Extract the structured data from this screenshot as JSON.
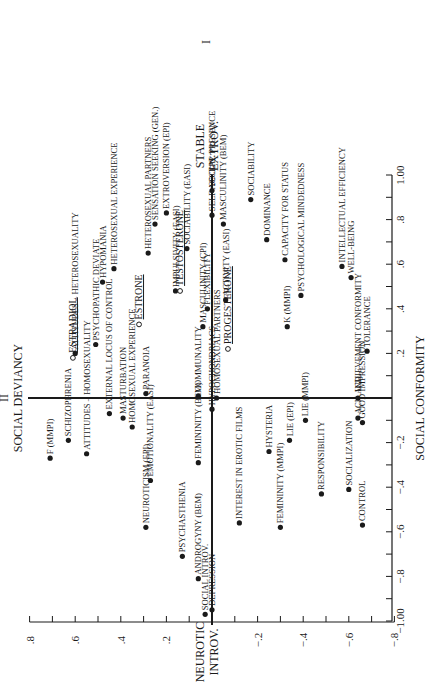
{
  "chart_data": {
    "type": "scatter",
    "title": "",
    "rotation": "rotated 90deg counter-clockwise on page",
    "xlabel": "SOCIAL CONFORMITY",
    "ylabel": "NEUROTIC INTROV. — STABLE EXTROV.",
    "factor_labels": {
      "factor_I_pos": "STABLE EXTROV.",
      "factor_I_neg": "NEUROTIC INTROV.",
      "factor_I_numeral": "I",
      "factor_II_label": "SOCIAL DEVIANCY",
      "factor_II_numeral": "II"
    },
    "xlim": [
      -1.0,
      1.0
    ],
    "ylim": [
      -0.8,
      0.8
    ],
    "x_ticks": [
      "-1.00",
      "-.8",
      "-.6",
      "-.4",
      "-.2",
      ".2",
      ".4",
      ".6",
      ".8",
      "1.00"
    ],
    "y_ticks": [
      ".8",
      ".6",
      ".4",
      ".2",
      "-.2",
      "-.4",
      "-.6",
      "-.8"
    ],
    "grid": false,
    "series": [
      {
        "name": "Personality / behavior variables",
        "marker": "filled-circle",
        "points": [
          {
            "label": "SOCIAL PRESENCE",
            "x": 0.93,
            "y": 0.0
          },
          {
            "label": "MASCULINITY (BEM)",
            "x": 0.78,
            "y": -0.05
          },
          {
            "label": "SOCIABILITY",
            "x": 0.89,
            "y": -0.17
          },
          {
            "label": "SELF ACCEPT.",
            "x": 0.82,
            "y": 0.0
          },
          {
            "label": "SOCIABILITY (EASI)",
            "x": 0.67,
            "y": 0.11
          },
          {
            "label": "SENSATION SEEKING (GEN.)",
            "x": 0.78,
            "y": 0.25
          },
          {
            "label": "EXTROVERSION (EPI)",
            "x": 0.83,
            "y": 0.2
          },
          {
            "label": "HETEROSEXUAL PARTNERS",
            "x": 0.65,
            "y": 0.28
          },
          {
            "label": "HETEROSEXUAL EXPERIENCE",
            "x": 0.58,
            "y": 0.43
          },
          {
            "label": "HYPOMANIA",
            "x": 0.52,
            "y": 0.48
          },
          {
            "label": "ATTITUDES – HETEROSEXUALITY",
            "x": 0.2,
            "y": 0.6
          },
          {
            "label": "PSYCHOPATHIC DEVIATE",
            "x": 0.24,
            "y": 0.51
          },
          {
            "label": "PARANOIA",
            "x": 0.02,
            "y": 0.29
          },
          {
            "label": "IMPULSIVITY (EASI)",
            "x": 0.48,
            "y": 0.16
          },
          {
            "label": "FLEXIBILITY",
            "x": 0.4,
            "y": 0.02
          },
          {
            "label": "MASCULINITY (CPI)",
            "x": 0.32,
            "y": 0.04
          },
          {
            "label": "ACTIVITY (EASI)",
            "x": 0.44,
            "y": -0.06
          },
          {
            "label": "DOMINANCE",
            "x": 0.71,
            "y": -0.24
          },
          {
            "label": "CAPACITY FOR STATUS",
            "x": 0.62,
            "y": -0.32
          },
          {
            "label": "K (MMPI)",
            "x": 0.32,
            "y": -0.33
          },
          {
            "label": "PSYCHOLOGICAL MINDEDNESS",
            "x": 0.46,
            "y": -0.39
          },
          {
            "label": "INTELLECTUAL EFFICIENCY",
            "x": 0.59,
            "y": -0.57
          },
          {
            "label": "WELL-BEING",
            "x": 0.54,
            "y": -0.61
          },
          {
            "label": "TOLERANCE",
            "x": 0.21,
            "y": -0.68
          },
          {
            "label": "ACHIEVEMENT CONFORMITY",
            "x": 0.0,
            "y": -0.64
          },
          {
            "label": "ACH. IND.",
            "x": -0.09,
            "y": -0.64
          },
          {
            "label": "GOOD IMPRESSION",
            "x": -0.11,
            "y": -0.66
          },
          {
            "label": "LIE (MMPI)",
            "x": -0.1,
            "y": -0.41
          },
          {
            "label": "LIE (EPI)",
            "x": -0.19,
            "y": -0.34
          },
          {
            "label": "HYSTERIA",
            "x": -0.24,
            "y": -0.25
          },
          {
            "label": "HOMOSEXUAL PARTNERS",
            "x": 0.0,
            "y": -0.02
          },
          {
            "label": "HYPOCHONDRIACS",
            "x": -0.05,
            "y": 0.0
          },
          {
            "label": "COMMUNALITY",
            "x": 0.01,
            "y": 0.06
          },
          {
            "label": "FEMININITY (BEM)",
            "x": -0.29,
            "y": 0.06
          },
          {
            "label": "INTEREST IN EROTIC FILMS",
            "x": -0.56,
            "y": -0.12
          },
          {
            "label": "FEMININITY (MMPI)",
            "x": -0.58,
            "y": -0.3
          },
          {
            "label": "RESPONSIBILITY",
            "x": -0.43,
            "y": -0.48
          },
          {
            "label": "SOCIALIZATION",
            "x": -0.41,
            "y": -0.6
          },
          {
            "label": "CONTROL",
            "x": -0.57,
            "y": -0.66
          },
          {
            "label": "DEPRESSION",
            "x": -0.95,
            "y": 0.0
          },
          {
            "label": "SOCIAL INTROV.",
            "x": -0.97,
            "y": 0.03
          },
          {
            "label": "ANDROGYNY (BEM)",
            "x": -0.81,
            "y": 0.06
          },
          {
            "label": "PSYCHASTHENIA",
            "x": -0.71,
            "y": 0.13
          },
          {
            "label": "NEUROTICISM (EPI)",
            "x": -0.58,
            "y": 0.29
          },
          {
            "label": "EMOTIONALITY (EASI)",
            "x": -0.37,
            "y": 0.27
          },
          {
            "label": "EXTERNAL LOCUS OF CONTROL",
            "x": -0.07,
            "y": 0.45
          },
          {
            "label": "MASTURBATION",
            "x": -0.09,
            "y": 0.39
          },
          {
            "label": "HOMOSEXUAL EXPERIENCE",
            "x": -0.13,
            "y": 0.35
          },
          {
            "label": "ATTITUDES – HOMOSEXUALITY",
            "x": -0.25,
            "y": 0.55
          },
          {
            "label": "SCHIZOPHRENIA",
            "x": -0.19,
            "y": 0.63
          },
          {
            "label": "F (MMPI)",
            "x": -0.27,
            "y": 0.71
          }
        ]
      },
      {
        "name": "Hormones",
        "marker": "open-circle",
        "points": [
          {
            "label": "ESTRADIOL",
            "x": 0.18,
            "y": 0.61
          },
          {
            "label": "ESTRONE",
            "x": 0.33,
            "y": 0.32
          },
          {
            "label": "TESTOSTERONE",
            "x": 0.48,
            "y": 0.14
          },
          {
            "label": "PROGESTERONE",
            "x": 0.22,
            "y": -0.07
          }
        ]
      }
    ]
  }
}
